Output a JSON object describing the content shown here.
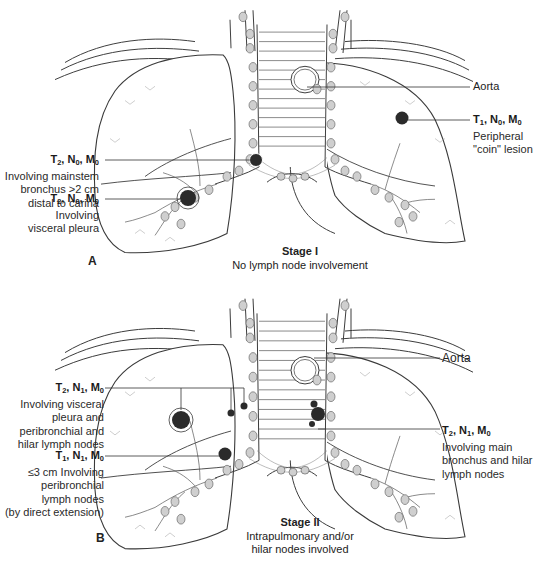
{
  "figure": {
    "panels": [
      {
        "letter": "A",
        "stage_title": "Stage I",
        "stage_subtitle": "No lymph node involvement",
        "structure_label": "Aorta",
        "annotations": [
          {
            "side": "left",
            "tnm": {
              "T": "2",
              "N": "0",
              "M": "0"
            },
            "lines": [
              "Involving mainstem",
              "bronchus >2 cm",
              "distal to carina"
            ]
          },
          {
            "side": "left",
            "tnm": {
              "T": "2",
              "N": "0",
              "M": "0"
            },
            "lines": [
              "Involving",
              "visceral pleura"
            ]
          },
          {
            "side": "right",
            "tnm": {
              "T": "1",
              "N": "0",
              "M": "0"
            },
            "lines": [
              "Peripheral",
              "\"coin\" lesion"
            ]
          }
        ]
      },
      {
        "letter": "B",
        "stage_title": "Stage II",
        "stage_subtitle_lines": [
          "Intrapulmonary and/or",
          "hilar nodes involved"
        ],
        "structure_label": "Aorta",
        "annotations": [
          {
            "side": "left",
            "tnm": {
              "T": "2",
              "N": "1",
              "M": "0"
            },
            "lines": [
              "Involving visceral",
              "pleura and",
              "peribronchial and",
              "hilar lymph nodes"
            ]
          },
          {
            "side": "left",
            "tnm": {
              "T": "1",
              "N": "1",
              "M": "0"
            },
            "lines": [
              "≤3 cm Involving",
              "peribronchial",
              "lymph nodes",
              "(by direct extension)"
            ]
          },
          {
            "side": "right",
            "tnm": {
              "T": "2",
              "N": "1",
              "M": "0"
            },
            "lines": [
              "Involving main",
              "bronchus and hilar",
              "lymph nodes"
            ]
          }
        ]
      }
    ],
    "colors": {
      "line": "#3a3a3a",
      "tumor": "#2b2b2b",
      "node": "#cfcfcf",
      "background": "#ffffff"
    }
  }
}
